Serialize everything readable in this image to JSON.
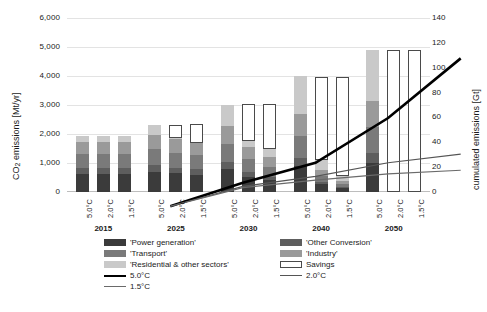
{
  "chart_data": {
    "type": "bar",
    "title": "",
    "ylabel": "CO2 emissions [Mt/yr]",
    "ylabel_html_parts": {
      "pre": "CO",
      "sub": "2",
      "post": " emissions [Mt/yr]"
    },
    "ylabel_right": "cumulated emissions [Gt]",
    "xlabel": "",
    "ylim": [
      0,
      6000
    ],
    "ylim_right": [
      0,
      140
    ],
    "yticks": [
      "0",
      "1,000",
      "2,000",
      "3,000",
      "4,000",
      "5,000",
      "6,000"
    ],
    "yticks_right": [
      "0",
      "20",
      "40",
      "60",
      "80",
      "100",
      "120",
      "140"
    ],
    "grid": true,
    "legend_position": "bottom",
    "groups": [
      "2015",
      "2025",
      "2030",
      "2040",
      "2050"
    ],
    "scenarios": [
      "5.0°C",
      "2.0°C",
      "1.5°C"
    ],
    "stack_order": [
      "Power generation",
      "Other Conversion",
      "Transport",
      "Industry",
      "Residential & other sectors"
    ],
    "colors": {
      "power_generation": "#3b3b3b",
      "other_conversion": "#5e5e5e",
      "transport": "#7a7a7a",
      "industry": "#9a9a9a",
      "residential_other": "#c9c9c9",
      "savings": "#ffffff",
      "savings_border": "#4a4a4a",
      "line_50": "#000000",
      "line_20": "#555555",
      "line_15": "#6a6a6a",
      "gridline": "#e3e3e3"
    },
    "series": [
      {
        "name": "Power generation",
        "values": [
          620,
          620,
          620,
          700,
          640,
          600,
          780,
          520,
          400,
          900,
          260,
          130,
          1000,
          0,
          0
        ]
      },
      {
        "name": "Other Conversion",
        "values": [
          200,
          200,
          200,
          220,
          200,
          190,
          240,
          170,
          130,
          280,
          90,
          50,
          330,
          0,
          0
        ]
      },
      {
        "name": "Transport",
        "values": [
          480,
          480,
          480,
          560,
          520,
          490,
          640,
          440,
          340,
          760,
          210,
          110,
          900,
          0,
          0
        ]
      },
      {
        "name": "Industry",
        "values": [
          440,
          440,
          440,
          500,
          460,
          430,
          620,
          410,
          320,
          740,
          200,
          100,
          900,
          0,
          0
        ]
      },
      {
        "name": "Residential & other sectors",
        "values": [
          200,
          200,
          200,
          320,
          280,
          260,
          720,
          460,
          310,
          1320,
          340,
          170,
          1770,
          0,
          0
        ]
      }
    ],
    "savings": {
      "name": "Savings",
      "bottoms": [
        null,
        null,
        null,
        null,
        1860,
        1700,
        null,
        1760,
        1480,
        null,
        1100,
        560,
        null,
        0,
        0
      ],
      "tops": [
        null,
        null,
        null,
        null,
        2300,
        2360,
        null,
        3020,
        3020,
        null,
        3980,
        3980,
        null,
        4890,
        4890
      ]
    },
    "lines": [
      {
        "name": "5.0°C",
        "right_axis": true,
        "x": [
          "2015",
          "2025",
          "2030",
          "2040",
          "2050"
        ],
        "values": [
          3,
          22,
          38,
          74,
          122
        ],
        "width": 2.6
      },
      {
        "name": "2.0°C",
        "right_axis": true,
        "x": [
          "2015",
          "2025",
          "2030",
          "2040",
          "2050"
        ],
        "values": [
          3,
          19,
          27,
          38,
          45
        ],
        "width": 1.2
      },
      {
        "name": "1.5°C",
        "right_axis": true,
        "x": [
          "2015",
          "2025",
          "2030",
          "2040",
          "2050"
        ],
        "values": [
          3,
          18,
          24,
          29,
          32
        ],
        "width": 1.2
      }
    ],
    "legend": [
      {
        "label": "'Power generation'",
        "kind": "swatch",
        "color": "#3b3b3b",
        "col": 0,
        "row": 0
      },
      {
        "label": "'Transport'",
        "kind": "swatch",
        "color": "#7a7a7a",
        "col": 0,
        "row": 1
      },
      {
        "label": "'Residential & other sectors'",
        "kind": "swatch",
        "color": "#c9c9c9",
        "col": 0,
        "row": 2
      },
      {
        "label": "5.0°C",
        "kind": "line-thick",
        "color": "#000000",
        "col": 0,
        "row": 3
      },
      {
        "label": "1.5°C",
        "kind": "line-thin",
        "color": "#6a6a6a",
        "col": 0,
        "row": 4
      },
      {
        "label": "'Other Conversion'",
        "kind": "swatch",
        "color": "#5e5e5e",
        "col": 1,
        "row": 0
      },
      {
        "label": "'Industry'",
        "kind": "swatch",
        "color": "#9a9a9a",
        "col": 1,
        "row": 1
      },
      {
        "label": "Savings",
        "kind": "open",
        "color": "#ffffff",
        "col": 1,
        "row": 2
      },
      {
        "label": "2.0°C",
        "kind": "line-thin",
        "color": "#555555",
        "col": 1,
        "row": 3
      }
    ]
  }
}
